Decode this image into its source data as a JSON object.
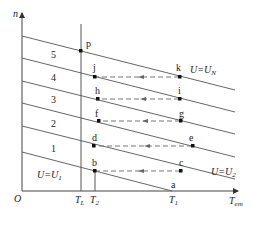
{
  "diagram": {
    "axes": {
      "y_label": "n",
      "x_label_main": "T",
      "x_label_sub": "em",
      "origin": "O"
    },
    "x_ticks": [
      {
        "main": "T",
        "sub": "L"
      },
      {
        "main": "T",
        "sub": "2"
      },
      {
        "main": "T",
        "sub": "1"
      }
    ],
    "regions": [
      "5",
      "4",
      "3",
      "2",
      "1"
    ],
    "line_labels": {
      "top": {
        "main": "U=U",
        "sub": "N"
      },
      "bottom_right": {
        "main": "U=U",
        "sub": "2"
      },
      "bottom_left": {
        "main": "U=U",
        "sub": "1"
      }
    },
    "points": [
      "p",
      "j",
      "k",
      "h",
      "i",
      "f",
      "g",
      "d",
      "e",
      "b",
      "c",
      "a"
    ],
    "colors": {
      "line": "#555555",
      "point": "#111111",
      "dash": "#666666"
    }
  }
}
